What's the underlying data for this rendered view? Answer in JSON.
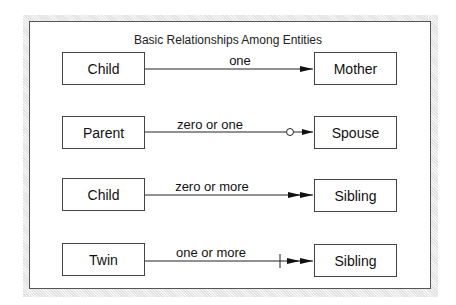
{
  "diagram": {
    "title": "Basic Relationships Among Entities",
    "relationships": [
      {
        "from": "Child",
        "label": "one",
        "to": "Mother",
        "notation": "single-arrow"
      },
      {
        "from": "Parent",
        "label": "zero or one",
        "to": "Spouse",
        "notation": "circle-single-arrow"
      },
      {
        "from": "Child",
        "label": "zero or more",
        "to": "Sibling",
        "notation": "double-arrow"
      },
      {
        "from": "Twin",
        "label": "one or more",
        "to": "Sibling",
        "notation": "bar-double-arrow"
      }
    ]
  }
}
